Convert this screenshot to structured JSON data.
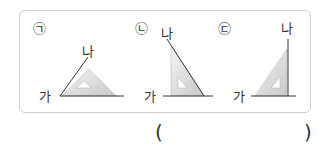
{
  "figures": [
    {
      "marker": "㉠",
      "top_label": "나",
      "left_label": "가"
    },
    {
      "marker": "㉡",
      "top_label": "나",
      "left_label": "가"
    },
    {
      "marker": "㉢",
      "top_label": "나",
      "left_label": "가"
    }
  ],
  "answer": {
    "open_paren": "(",
    "close_paren": ")",
    "value": ""
  }
}
